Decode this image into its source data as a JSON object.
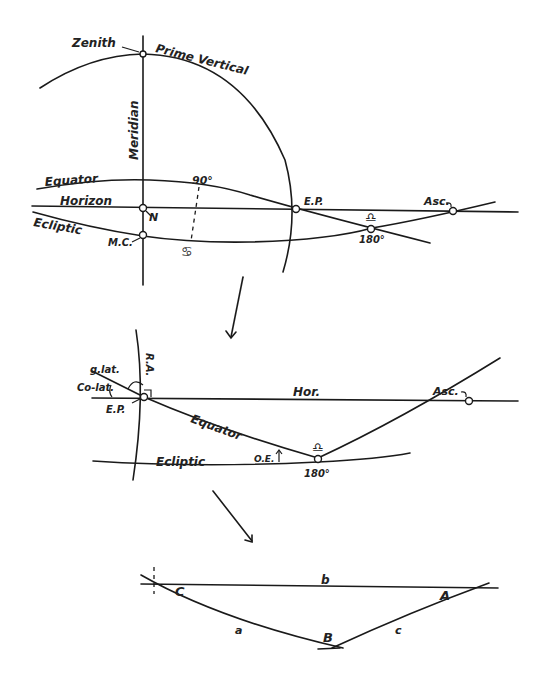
{
  "figure": {
    "panel1": {
      "labels": {
        "zenith": "Zenith",
        "prime_vertical": "Prime Vertical",
        "meridian": "Meridian",
        "equator": "Equator",
        "horizon": "Horizon",
        "ecliptic": "Ecliptic",
        "north": "N",
        "mc": "M.C.",
        "ninety": "90°",
        "cancer": "♋",
        "ep": "E.P.",
        "libra": "♎",
        "one_eighty": "180°",
        "asc": "Asc."
      }
    },
    "panel2": {
      "labels": {
        "ra": "R.A.",
        "geo_lat": "g.lat.",
        "colat": "Co-lat.",
        "ep": "E.P.",
        "hor": "Hor.",
        "asc": "Asc.",
        "equator": "Equator",
        "ecliptic": "Ecliptic",
        "oe": "O.E.",
        "libra": "♎",
        "one_eighty": "180°"
      }
    },
    "panel3": {
      "labels": {
        "b": "b",
        "C": "C",
        "A": "A",
        "a": "a",
        "B": "B",
        "c": "c"
      }
    }
  }
}
